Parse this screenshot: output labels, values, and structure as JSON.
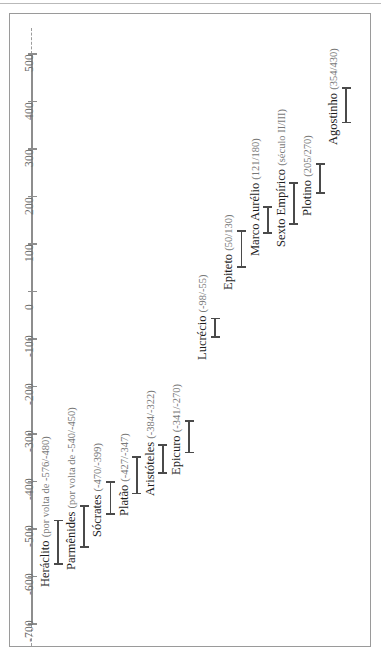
{
  "figure": {
    "title": "",
    "axis_label": ""
  },
  "chart_data": {
    "type": "bar",
    "orientation": "horizontal-timeline",
    "title": "",
    "xlabel": "",
    "ylabel": "",
    "axis_label": "Ano",
    "axis_ticks": [
      500,
      400,
      300,
      200,
      100,
      0,
      -100,
      -200,
      -300,
      -400,
      -500,
      -600,
      -700
    ],
    "axis_tick_labels": [
      "500",
      "400",
      "300",
      "200",
      "100",
      "0",
      "-100",
      "-200",
      "-300",
      "-400",
      "-500",
      "-600",
      "-700"
    ],
    "axis_range": [
      -760,
      560
    ],
    "grid": false,
    "legend": "none",
    "axis_extends_dashed": true,
    "categories": [
      "Heráclito",
      "Parmênides",
      "Sócrates",
      "Platão",
      "Aristóteles",
      "Epicuro",
      "Lucrécio",
      "Epiteto",
      "Marco Aurélio",
      "Sexto Empírico",
      "Plotino",
      "Agostinho"
    ],
    "entries": [
      {
        "name": "Heráclito",
        "dates": "(por volta de -576/-480)",
        "label": "Heráclito (por volta de -576/-480)",
        "start": -576,
        "end": -480,
        "approximate": true
      },
      {
        "name": "Parmênides",
        "dates": "(por volta de -540/-450)",
        "label": "Parmênides (por volta de -540/-450)",
        "start": -540,
        "end": -450,
        "approximate": true
      },
      {
        "name": "Sócrates",
        "dates": "(-470/-399)",
        "label": "Sócrates (-470/-399)",
        "start": -470,
        "end": -399,
        "approximate": false
      },
      {
        "name": "Platão",
        "dates": "(-427/-347)",
        "label": "Platão (-427/-347)",
        "start": -427,
        "end": -347,
        "approximate": false
      },
      {
        "name": "Aristóteles",
        "dates": "(-384/-322)",
        "label": "Aristóteles (-384/-322)",
        "start": -384,
        "end": -322,
        "approximate": false
      },
      {
        "name": "Epicuro",
        "dates": "(-341/-270)",
        "label": "Epicuro (-341/-270)",
        "start": -341,
        "end": -270,
        "approximate": false
      },
      {
        "name": "Lucrécio",
        "dates": "(-98/-55)",
        "label": "Lucrécio (-98/-55)",
        "start": -98,
        "end": -55,
        "approximate": false
      },
      {
        "name": "Epiteto",
        "dates": "(50/130)",
        "label": "Epiteto (50/130)",
        "start": 50,
        "end": 130,
        "approximate": false
      },
      {
        "name": "Marco Aurélio",
        "dates": "(121/180)",
        "label": "Marco Aurélio (121/180)",
        "start": 121,
        "end": 180,
        "approximate": false
      },
      {
        "name": "Sexto Empírico",
        "dates": "(século II/III)",
        "label": "Sexto Empírico (século II/III)",
        "start": 140,
        "end": 230,
        "approximate": true
      },
      {
        "name": "Plotino",
        "dates": "(205/270)",
        "label": "Plotino (205/270)",
        "start": 205,
        "end": 270,
        "approximate": false
      },
      {
        "name": "Agostinho",
        "dates": "(354/430)",
        "label": "Agostinho (354/430)",
        "start": 354,
        "end": 430,
        "approximate": false
      }
    ],
    "colors": {
      "bar": "#4a4a4a",
      "axis": "#8d8d8d",
      "tick_label": "#6d6d6d",
      "name_text": "#1d1d1d",
      "date_text": "#787878",
      "frame": "#9a9a9a",
      "background": "#ffffff"
    }
  }
}
